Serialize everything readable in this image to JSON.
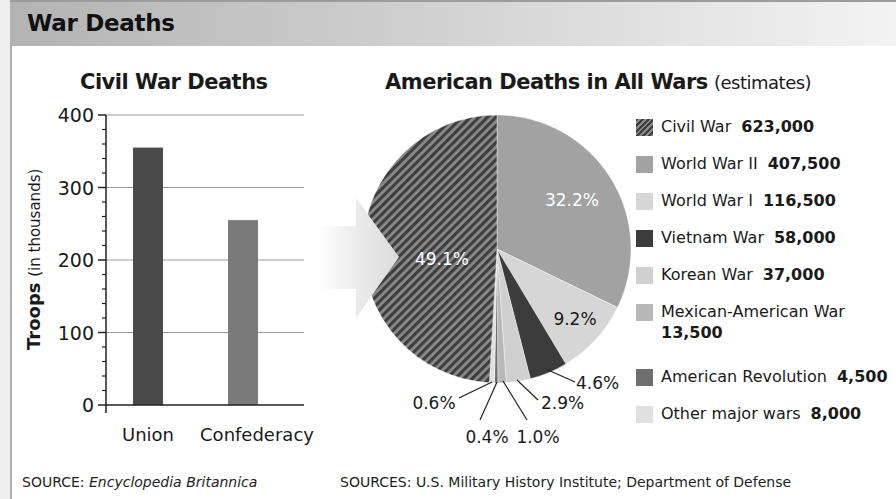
{
  "header": {
    "title": "War Deaths"
  },
  "colors": {
    "union": "#4a4a4a",
    "confederacy": "#7a7a7a",
    "civil_war": "#5a5a5a",
    "wwii": "#a2a2a2",
    "wwi": "#d6d6d6",
    "vietnam": "#3c3c3c",
    "korean": "#d0d0d0",
    "mexican": "#b8b8b8",
    "am_rev": "#6e6e6e",
    "other": "#e0e0e0"
  },
  "bar_chart": {
    "title": "Civil War Deaths",
    "ylabel_bold": "Troops",
    "ylabel_rest": "(in thousands)",
    "source_label": "SOURCE:",
    "source_text": "Encyclopedia Britannica"
  },
  "pie_chart": {
    "title_bold": "American Deaths in All Wars",
    "title_rest": "(estimates)",
    "source_label": "SOURCES:",
    "source_text": "U.S. Military History Institute; Department of Defense"
  },
  "legend": [
    {
      "label": "Civil War",
      "value": "623,000"
    },
    {
      "label": "World War II",
      "value": "407,500"
    },
    {
      "label": "World War I",
      "value": "116,500"
    },
    {
      "label": "Vietnam War",
      "value": "58,000"
    },
    {
      "label": "Korean War",
      "value": "37,000"
    },
    {
      "label": "Mexican-American War",
      "value": "13,500"
    },
    {
      "label": "American Revolution",
      "value": "4,500"
    },
    {
      "label": "Other major wars",
      "value": "8,000"
    }
  ],
  "chart_data": [
    {
      "type": "bar",
      "title": "Civil War Deaths",
      "categories": [
        "Union",
        "Confederacy"
      ],
      "values": [
        355,
        255
      ],
      "xlabel": "",
      "ylabel": "Troops (in thousands)",
      "ylim": [
        0,
        400
      ],
      "yticks": [
        0,
        100,
        200,
        300,
        400
      ],
      "grid": true,
      "source": "SOURCE: Encyclopedia Britannica"
    },
    {
      "type": "pie",
      "title": "American Deaths in All Wars (estimates)",
      "slices": [
        {
          "name": "World War II",
          "deaths": 407500,
          "percent": 32.2,
          "label": "32.2%"
        },
        {
          "name": "World War I",
          "deaths": 116500,
          "percent": 9.2,
          "label": "9.2%"
        },
        {
          "name": "Vietnam War",
          "deaths": 58000,
          "percent": 4.6,
          "label": "4.6%"
        },
        {
          "name": "Korean War",
          "deaths": 37000,
          "percent": 2.9,
          "label": "2.9%"
        },
        {
          "name": "Mexican-American War",
          "deaths": 13500,
          "percent": 1.0,
          "label": "1.0%"
        },
        {
          "name": "American Revolution",
          "deaths": 4500,
          "percent": 0.4,
          "label": "0.4%"
        },
        {
          "name": "Other major wars",
          "deaths": 8000,
          "percent": 0.6,
          "label": "0.6%"
        },
        {
          "name": "Civil War",
          "deaths": 623000,
          "percent": 49.1,
          "label": "49.1%"
        }
      ],
      "legend_position": "right",
      "source": "SOURCES: U.S. Military History Institute; Department of Defense"
    }
  ]
}
